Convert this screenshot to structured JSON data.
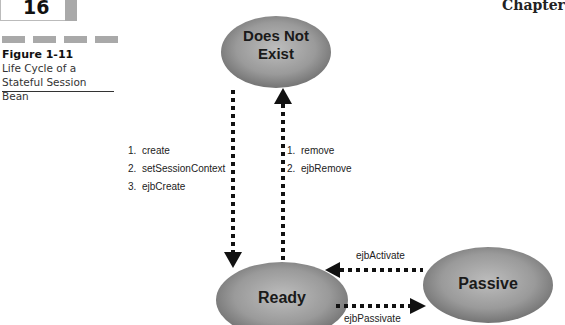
{
  "header": {
    "page_number": "16",
    "chapter_label": "Chapter"
  },
  "figure": {
    "label": "Figure 1-11",
    "caption": "Life Cycle of a Stateful Session Bean"
  },
  "diagram": {
    "states": {
      "does_not_exist": "Does Not Exist",
      "does_not_exist_line1": "Does Not",
      "does_not_exist_line2": "Exist",
      "ready": "Ready",
      "passive": "Passive"
    },
    "transitions": {
      "create": {
        "from": "Does Not Exist",
        "to": "Ready",
        "steps": [
          {
            "num": "1.",
            "label": "create"
          },
          {
            "num": "2.",
            "label": "setSessionContext"
          },
          {
            "num": "3.",
            "label": "ejbCreate"
          }
        ]
      },
      "remove": {
        "from": "Ready",
        "to": "Does Not Exist",
        "steps": [
          {
            "num": "1.",
            "label": "remove"
          },
          {
            "num": "2.",
            "label": "ejbRemove"
          }
        ]
      },
      "activate": {
        "from": "Passive",
        "to": "Ready",
        "label": "ejbActivate"
      },
      "passivate": {
        "from": "Ready",
        "to": "Passive",
        "label": "ejbPassivate"
      }
    },
    "colors": {
      "state_fill_center": "#b5b5b5",
      "state_fill_edge": "#6e6e6e",
      "arrow": "#111111",
      "accent_gray": "#a9a9a9"
    }
  }
}
